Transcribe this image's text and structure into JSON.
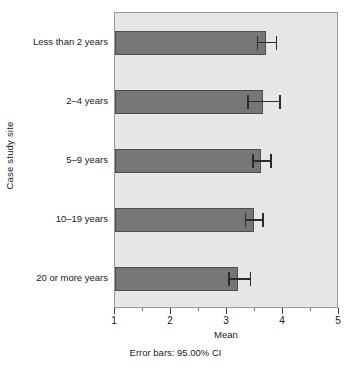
{
  "chart_data": {
    "type": "bar",
    "orientation": "horizontal",
    "title": "",
    "xlabel": "Mean",
    "ylabel": "Case study site",
    "footnote": "Error bars: 95.00% CI",
    "xlim": [
      1,
      5
    ],
    "grid": false,
    "legend": null,
    "x_ticks": [
      {
        "value": 1,
        "label": "1"
      },
      {
        "value": 2,
        "label": "2"
      },
      {
        "value": 3,
        "label": "3"
      },
      {
        "value": 4,
        "label": "4"
      },
      {
        "value": 5,
        "label": "5"
      }
    ],
    "x_minor_ticks": [
      1.5,
      2.5,
      3.5,
      4.5
    ],
    "categories": [
      "Less than 2 years",
      "2–4 years",
      "5–9 years",
      "10–19 years",
      "20 or more years"
    ],
    "values": [
      3.69,
      3.65,
      3.61,
      3.48,
      3.2
    ],
    "ci_low": [
      3.53,
      3.36,
      3.45,
      3.32,
      3.02
    ],
    "ci_high": [
      3.87,
      3.93,
      3.77,
      3.63,
      3.41
    ],
    "bars": [
      {
        "category": "Less than 2 years",
        "mean": 3.69,
        "ci_low": 3.53,
        "ci_high": 3.87
      },
      {
        "category": "2–4 years",
        "mean": 3.65,
        "ci_low": 3.36,
        "ci_high": 3.93
      },
      {
        "category": "5–9 years",
        "mean": 3.61,
        "ci_low": 3.45,
        "ci_high": 3.77
      },
      {
        "category": "10–19 years",
        "mean": 3.48,
        "ci_low": 3.32,
        "ci_high": 3.63
      },
      {
        "category": "20 or more years",
        "mean": 3.2,
        "ci_low": 3.02,
        "ci_high": 3.41
      }
    ],
    "colors": {
      "bar_fill": "#767676",
      "bar_stroke": "#4d4d4d",
      "plot_background": "#e7e7e7",
      "plot_border": "#9a9a9a",
      "error_bar": "#2b2b2b",
      "text": "#1a1a1a",
      "page_background": "#ffffff"
    }
  }
}
